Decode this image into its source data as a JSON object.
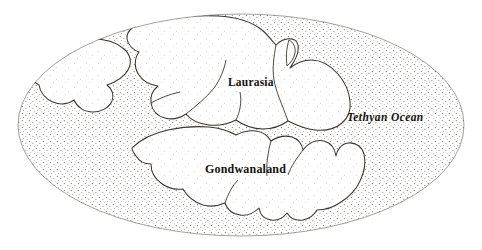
{
  "figure": {
    "kind": "historical-paleogeographic-map",
    "background_color": "#ffffff",
    "ink_color": "#16120e",
    "outline_color": "#3b342c",
    "stipple_color": "#4a443c"
  },
  "globe": {
    "name": "pangaea-ellipse",
    "center_x": 241,
    "center_y": 125,
    "radius_x": 223,
    "radius_y": 111
  },
  "labels": [
    {
      "id": "laurasia",
      "text": "Laurasia",
      "style": "bold",
      "x": 228,
      "y": 77
    },
    {
      "id": "gondwanaland",
      "text": "Gondwanaland",
      "style": "bold",
      "x": 205,
      "y": 163
    },
    {
      "id": "tethyan-ocean",
      "text": "Tethyan Ocean",
      "style": "bold-italic",
      "x": 347,
      "y": 112
    }
  ],
  "landmasses": [
    {
      "id": "laurasia-mass",
      "label": "Laurasia"
    },
    {
      "id": "gondwanaland-mass",
      "label": "Gondwanaland"
    },
    {
      "id": "north-america-block",
      "label": "northwestern block"
    },
    {
      "id": "iberia-block",
      "label": "small western block"
    }
  ],
  "ocean": {
    "id": "tethyan-ocean-body",
    "label": "Tethyan Ocean"
  }
}
